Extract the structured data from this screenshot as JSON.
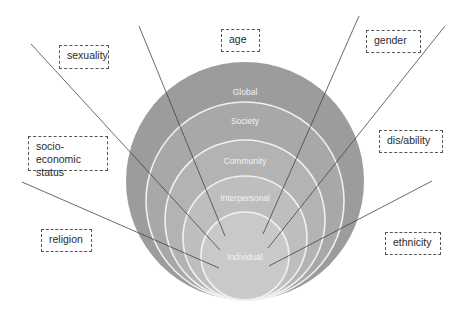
{
  "diagram": {
    "type": "nested-circles-intersectionality",
    "levels": [
      {
        "label": "Global",
        "color": "#9a9a9a"
      },
      {
        "label": "Society",
        "color": "#a6a6a6"
      },
      {
        "label": "Community",
        "color": "#b2b2b2"
      },
      {
        "label": "Interpersonal",
        "color": "#bdbdbd"
      },
      {
        "label": "Individual",
        "color": "#c9c9c9"
      }
    ],
    "factors": [
      {
        "label": "sexuality"
      },
      {
        "label": "age"
      },
      {
        "label": "gender"
      },
      {
        "label": "socio-economic status"
      },
      {
        "label": "dis/ability"
      },
      {
        "label": "religion"
      },
      {
        "label": "ethnicity"
      }
    ],
    "ring_stroke": "#f5f5f5",
    "connector_color": "#444444"
  }
}
